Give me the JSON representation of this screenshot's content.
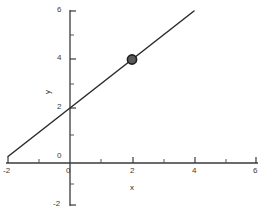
{
  "chart_data": {
    "type": "line",
    "title": "",
    "subtitle": "",
    "xlabel": "x",
    "ylabel": "y",
    "xlim": [
      -2,
      6
    ],
    "ylim": [
      -2,
      6
    ],
    "xticks": [
      -2,
      0,
      2,
      4,
      6
    ],
    "yticks": [
      -2,
      0,
      2,
      4,
      6
    ],
    "xtick_labels": [
      "-2",
      "0",
      "2",
      "4",
      "6"
    ],
    "ytick_labels": [
      "-2",
      "0",
      "2",
      "4",
      "6"
    ],
    "x_minor_ticks": [
      -1,
      1,
      3,
      5
    ],
    "y_minor_ticks": [
      -1,
      1,
      3,
      5
    ],
    "grid": false,
    "legend": null,
    "series": [
      {
        "name": "y = x + 2",
        "kind": "line",
        "x": [
          -2,
          4
        ],
        "y": [
          0,
          6
        ],
        "slope": 1,
        "intercept": 2,
        "color": "#2b2b2b",
        "linewidth": 1.4
      },
      {
        "name": "marked point",
        "kind": "scatter",
        "x": [
          2
        ],
        "y": [
          4
        ],
        "labels": [
          "(2, 4)"
        ],
        "marker": "circle",
        "fill_color": "#5a5a5a",
        "edge_color": "#1f1f1f",
        "size": 8
      }
    ],
    "annotations": [],
    "colors": {
      "axis": "#3a3a3a",
      "line": "#2b2b2b",
      "marker_fill": "#5a5a5a",
      "marker_edge": "#1f1f1f",
      "background": "#ffffff",
      "text": "#3a3a3a"
    }
  },
  "axes": {
    "x_title": "x",
    "y_title": "y",
    "x_labels": [
      {
        "text": "-2",
        "x": 8,
        "y": 172
      },
      {
        "text": "0",
        "x": 69,
        "y": 172
      },
      {
        "text": "2",
        "x": 133,
        "y": 172
      },
      {
        "text": "4",
        "x": 195,
        "y": 172
      },
      {
        "text": "6",
        "x": 256,
        "y": 172
      }
    ],
    "y_labels": [
      {
        "text": "6",
        "x": 61,
        "y": 10
      },
      {
        "text": "4",
        "x": 61,
        "y": 58
      },
      {
        "text": "2",
        "x": 61,
        "y": 108
      },
      {
        "text": "0",
        "x": 61,
        "y": 163
      },
      {
        "text": "-2",
        "x": 61,
        "y": 205
      }
    ]
  }
}
